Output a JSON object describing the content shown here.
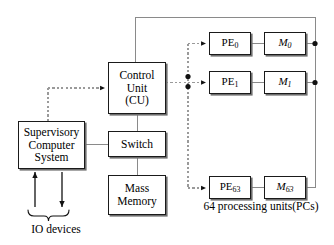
{
  "diagram": {
    "colors": {
      "box_border": "#1a1a1a",
      "box_shadow": "#6e6e6e",
      "solid_wire": "#7a7a7a",
      "dotted_wire": "#9a9a9a",
      "arrow_dark": "#111111",
      "background": "#ffffff"
    }
  },
  "blocks": {
    "control_unit": {
      "line1": "Control",
      "line2": "Unit",
      "line3": "(CU)"
    },
    "switch": {
      "line1": "Switch"
    },
    "mass_memory": {
      "line1": "Mass",
      "line2": "Memory"
    },
    "supervisory": {
      "line1": "Supervisory",
      "line2": "Computer",
      "line3": "System"
    }
  },
  "processing_elements": [
    {
      "pe_prefix": "PE",
      "pe_index": "0",
      "mem_prefix": "M",
      "mem_index": "0"
    },
    {
      "pe_prefix": "PE",
      "pe_index": "1",
      "mem_prefix": "M",
      "mem_index": "1"
    },
    {
      "pe_prefix": "PE",
      "pe_index": "63",
      "mem_prefix": "M",
      "mem_index": "63"
    }
  ],
  "captions": {
    "pcs_line1": "64 processing",
    "pcs_line2": "units(PCs)",
    "io_devices": "IO devices"
  }
}
